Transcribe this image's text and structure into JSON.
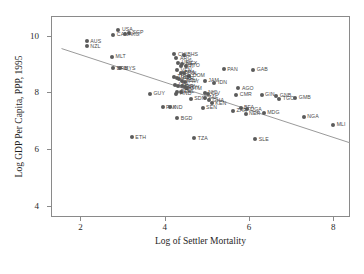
{
  "chart_data": {
    "type": "scatter",
    "title": "",
    "xlabel": "Log of Settler Mortality",
    "ylabel": "Log GDP Per Capita, PPP, 1995",
    "xlim": [
      1.3,
      8.4
    ],
    "ylim": [
      3.6,
      10.7
    ],
    "xticks": [
      2,
      4,
      6,
      8
    ],
    "yticks": [
      4,
      6,
      8,
      10
    ],
    "xtick_labels": [
      "2",
      "4",
      "6",
      "8"
    ],
    "ytick_labels": [
      "4",
      "6",
      "8",
      "10"
    ],
    "grid": false,
    "legend": "none",
    "marker_color": "#5b5b5b",
    "label_color": "#4a4a4a",
    "frame_color": "#8a8a8a",
    "fit_line": {
      "color": "#9a9a9a",
      "x0": 1.55,
      "y0": 9.55,
      "x1": 8.4,
      "y1": 6.22
    },
    "points": [
      {
        "label": "AUS",
        "x": 2.15,
        "y": 9.8
      },
      {
        "label": "NZL",
        "x": 2.15,
        "y": 9.63
      },
      {
        "label": "USA",
        "x": 2.9,
        "y": 10.22
      },
      {
        "label": "CAN",
        "x": 2.78,
        "y": 10.03
      },
      {
        "label": "SGP",
        "x": 3.15,
        "y": 10.1
      },
      {
        "label": "HKG",
        "x": 3.05,
        "y": 10.05
      },
      {
        "label": "MLT",
        "x": 2.75,
        "y": 9.25
      },
      {
        "label": "BRB",
        "x": 2.78,
        "y": 8.85
      },
      {
        "label": "MYS",
        "x": 2.95,
        "y": 8.85
      },
      {
        "label": "CHL",
        "x": 4.23,
        "y": 9.35
      },
      {
        "label": "BHS",
        "x": 4.45,
        "y": 9.32
      },
      {
        "label": "ARG",
        "x": 4.28,
        "y": 9.2
      },
      {
        "label": "URY",
        "x": 4.32,
        "y": 9.05
      },
      {
        "label": "MEX",
        "x": 4.42,
        "y": 9.02
      },
      {
        "label": "CRI",
        "x": 4.38,
        "y": 8.92
      },
      {
        "label": "TTO",
        "x": 4.5,
        "y": 8.95
      },
      {
        "label": "PAN",
        "x": 5.4,
        "y": 8.82
      },
      {
        "label": "GAB",
        "x": 6.1,
        "y": 8.8
      },
      {
        "label": "VEN",
        "x": 4.3,
        "y": 8.78
      },
      {
        "label": "BRA",
        "x": 4.38,
        "y": 8.7
      },
      {
        "label": "COL",
        "x": 4.45,
        "y": 8.68
      },
      {
        "label": "DOM",
        "x": 4.58,
        "y": 8.58
      },
      {
        "label": "TUN",
        "x": 4.22,
        "y": 8.55
      },
      {
        "label": "DZA",
        "x": 4.3,
        "y": 8.52
      },
      {
        "label": "PER",
        "x": 4.35,
        "y": 8.48
      },
      {
        "label": "ECU",
        "x": 4.42,
        "y": 8.42
      },
      {
        "label": "PRY",
        "x": 4.48,
        "y": 8.38
      },
      {
        "label": "JAM",
        "x": 4.95,
        "y": 8.42
      },
      {
        "label": "IDN",
        "x": 5.18,
        "y": 8.35
      },
      {
        "label": "LKA",
        "x": 4.25,
        "y": 8.28
      },
      {
        "label": "MAR",
        "x": 4.32,
        "y": 8.22
      },
      {
        "label": "SLV",
        "x": 4.4,
        "y": 8.22
      },
      {
        "label": "EGY",
        "x": 4.48,
        "y": 8.18
      },
      {
        "label": "GTM",
        "x": 4.52,
        "y": 8.15
      },
      {
        "label": "AGO",
        "x": 5.75,
        "y": 8.15
      },
      {
        "label": "BOL",
        "x": 4.3,
        "y": 8.02
      },
      {
        "label": "PHL",
        "x": 4.38,
        "y": 8.02
      },
      {
        "label": "HND",
        "x": 4.28,
        "y": 7.95
      },
      {
        "label": "NIC",
        "x": 4.95,
        "y": 7.98
      },
      {
        "label": "CIV",
        "x": 5.02,
        "y": 7.95
      },
      {
        "label": "CMR",
        "x": 5.7,
        "y": 7.92
      },
      {
        "label": "GIN",
        "x": 6.3,
        "y": 7.92
      },
      {
        "label": "GNB",
        "x": 6.65,
        "y": 7.88
      },
      {
        "label": "TGO",
        "x": 6.72,
        "y": 7.78
      },
      {
        "label": "GMB",
        "x": 7.1,
        "y": 7.8
      },
      {
        "label": "GUY",
        "x": 3.65,
        "y": 7.95
      },
      {
        "label": "SDN",
        "x": 4.62,
        "y": 7.78
      },
      {
        "label": "ZAF",
        "x": 4.95,
        "y": 7.8
      },
      {
        "label": "GHA",
        "x": 5.05,
        "y": 7.72
      },
      {
        "label": "KEN",
        "x": 5.12,
        "y": 7.62
      },
      {
        "label": "PAK",
        "x": 3.95,
        "y": 7.48
      },
      {
        "label": "IND",
        "x": 4.12,
        "y": 7.48
      },
      {
        "label": "SEN",
        "x": 4.9,
        "y": 7.45
      },
      {
        "label": "BFA",
        "x": 5.8,
        "y": 7.45
      },
      {
        "label": "UGA",
        "x": 5.95,
        "y": 7.4
      },
      {
        "label": "ZAR",
        "x": 5.62,
        "y": 7.35
      },
      {
        "label": "NER",
        "x": 5.92,
        "y": 7.25
      },
      {
        "label": "MDG",
        "x": 6.35,
        "y": 7.28
      },
      {
        "label": "NGA",
        "x": 7.3,
        "y": 7.15
      },
      {
        "label": "MLI",
        "x": 8.0,
        "y": 6.85
      },
      {
        "label": "BGD",
        "x": 4.3,
        "y": 7.08
      },
      {
        "label": "ETH",
        "x": 3.22,
        "y": 6.42
      },
      {
        "label": "TZA",
        "x": 4.7,
        "y": 6.38
      },
      {
        "label": "SLE",
        "x": 6.15,
        "y": 6.35
      }
    ]
  }
}
